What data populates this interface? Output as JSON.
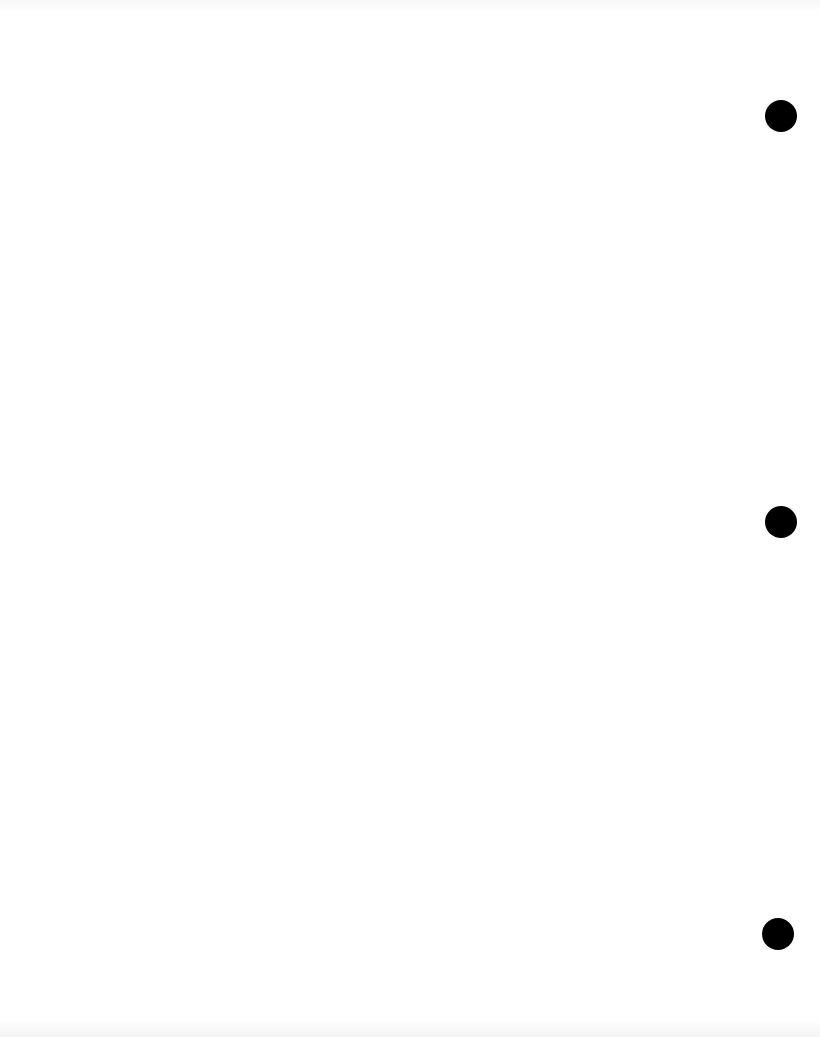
{
  "page": {
    "type": "blank scanned page",
    "background_color": "#ffffff",
    "punch_holes": [
      {
        "cx": 781,
        "cy": 116,
        "r": 16
      },
      {
        "cx": 781,
        "cy": 522,
        "r": 16
      },
      {
        "cx": 778,
        "cy": 934,
        "r": 16
      }
    ],
    "hole_color": "#000000"
  }
}
